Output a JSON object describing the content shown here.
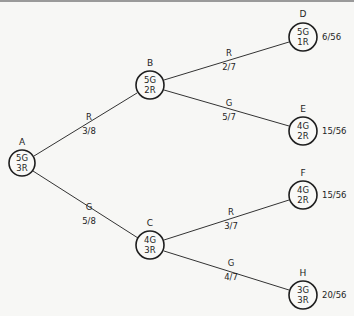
{
  "diagram": {
    "type": "probability-tree",
    "nodes": [
      {
        "id": "A",
        "line1": "5G",
        "line2": "3R",
        "x": 22,
        "y": 163
      },
      {
        "id": "B",
        "line1": "5G",
        "line2": "2R",
        "x": 150,
        "y": 85
      },
      {
        "id": "C",
        "line1": "4G",
        "line2": "3R",
        "x": 150,
        "y": 245
      },
      {
        "id": "D",
        "line1": "5G",
        "line2": "1R",
        "x": 303,
        "y": 37,
        "probability": "6/56"
      },
      {
        "id": "E",
        "line1": "4G",
        "line2": "2R",
        "x": 303,
        "y": 131,
        "probability": "15/56"
      },
      {
        "id": "F",
        "line1": "4G",
        "line2": "2R",
        "x": 303,
        "y": 195,
        "probability": "15/56"
      },
      {
        "id": "H",
        "line1": "3G",
        "line2": "3R",
        "x": 303,
        "y": 295,
        "probability": "20/56"
      }
    ],
    "edges": [
      {
        "from": "A",
        "to": "B",
        "color": "R",
        "prob": "3/8"
      },
      {
        "from": "A",
        "to": "C",
        "color": "G",
        "prob": "5/8"
      },
      {
        "from": "B",
        "to": "D",
        "color": "R",
        "prob": "2/7"
      },
      {
        "from": "B",
        "to": "E",
        "color": "G",
        "prob": "5/7"
      },
      {
        "from": "C",
        "to": "F",
        "color": "R",
        "prob": "3/7"
      },
      {
        "from": "C",
        "to": "H",
        "color": "G",
        "prob": "4/7"
      }
    ]
  }
}
